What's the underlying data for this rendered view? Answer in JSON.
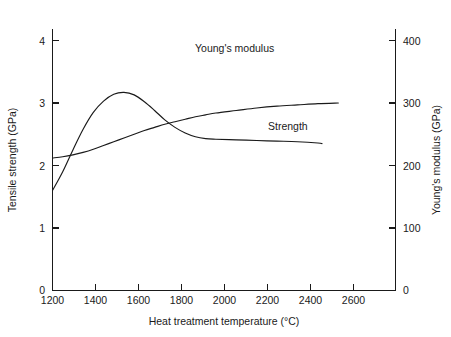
{
  "chart_data": {
    "type": "line",
    "title": "",
    "xlabel": "Heat treatment temperature   (°C)",
    "ylabel": "Tensile strength   (GPa)",
    "y2label": "Young's modulus (GPa)",
    "xlim": [
      1200,
      2880
    ],
    "ylim": [
      0,
      4
    ],
    "y2lim": [
      0,
      400
    ],
    "grid": false,
    "xticks": [
      1200,
      1400,
      1600,
      1800,
      2000,
      2200,
      2400,
      2600
    ],
    "xtick_labels": [
      "1200",
      "1400",
      "1600",
      "1800",
      "2000",
      "2200",
      "2400",
      "2600"
    ],
    "yticks": [
      0,
      1,
      2,
      3,
      4
    ],
    "ytick_labels": [
      "0",
      "1",
      "2",
      "3",
      "4"
    ],
    "y2ticks": [
      0,
      100,
      200,
      300,
      400
    ],
    "y2tick_labels": [
      "0",
      "100",
      "200",
      "300",
      "400"
    ],
    "legend_position": "inline-annotations",
    "series": [
      {
        "name": "Strength",
        "axis": "left",
        "units": "GPa",
        "annotation": "Strength",
        "x": [
          1200,
          1250,
          1300,
          1350,
          1400,
          1450,
          1500,
          1550,
          1600,
          1650,
          1700,
          1750,
          1800,
          1850,
          1900,
          1950,
          2000,
          2100,
          2200,
          2300,
          2400,
          2500,
          2600
        ],
        "y": [
          2.12,
          2.14,
          2.17,
          2.21,
          2.26,
          2.32,
          2.38,
          2.44,
          2.5,
          2.56,
          2.61,
          2.66,
          2.7,
          2.74,
          2.78,
          2.81,
          2.84,
          2.88,
          2.92,
          2.95,
          2.97,
          2.99,
          3.0
        ]
      },
      {
        "name": "Young's modulus",
        "axis": "right",
        "units": "GPa",
        "annotation": "Young's modulus",
        "x": [
          1200,
          1250,
          1300,
          1350,
          1400,
          1450,
          1500,
          1550,
          1600,
          1650,
          1700,
          1750,
          1800,
          1850,
          1900,
          1950,
          2000,
          2100,
          2200,
          2300,
          2400,
          2500,
          2520
        ],
        "y": [
          160,
          190,
          225,
          258,
          285,
          303,
          314,
          317,
          313,
          302,
          288,
          273,
          261,
          252,
          246,
          243,
          242,
          241,
          240,
          239,
          238,
          236,
          235
        ]
      }
    ],
    "annotations": [
      {
        "text": "Young's modulus",
        "x_px": 195,
        "y_px": 52
      },
      {
        "text": "Strength",
        "x_px": 268,
        "y_px": 130
      }
    ],
    "notes": {
      "crossover_temperature_C": 1750,
      "strength_peak_temperature_C": 1550,
      "strength_peak_value_GPa": 3.17
    }
  }
}
